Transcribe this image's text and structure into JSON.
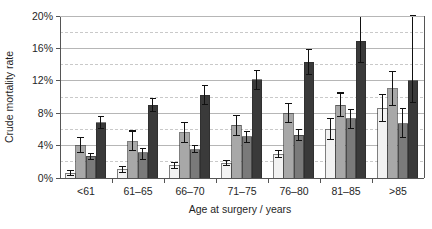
{
  "chart_data": {
    "type": "bar",
    "title": "",
    "xlabel": "Age at surgery / years",
    "ylabel": "Crude mortality rate",
    "categories": [
      "<61",
      "61–65",
      "66–70",
      "71–75",
      "76–80",
      "81–85",
      ">85"
    ],
    "ylim": [
      0,
      20
    ],
    "yunit": "%",
    "yticks": [
      0,
      4,
      8,
      12,
      16,
      20
    ],
    "yticklabels": [
      "0%",
      "4%",
      "8%",
      "12%",
      "16%",
      "20%"
    ],
    "yminor": [
      2,
      6,
      10,
      14,
      18
    ],
    "grid": "horizontal major solid plus dashed minor",
    "legend": "none",
    "error_bars": "vertical whiskers with caps (95% CI)",
    "series": [
      {
        "name": "series-1",
        "color": "#f2f2f2",
        "values": [
          0.6,
          1.0,
          1.5,
          1.8,
          2.9,
          6.0,
          8.6
        ],
        "err_low": [
          0.3,
          0.7,
          1.2,
          1.5,
          2.5,
          4.7,
          7.0
        ],
        "err_high": [
          0.9,
          1.4,
          1.9,
          2.2,
          3.4,
          7.3,
          10.3
        ]
      },
      {
        "name": "series-2",
        "color": "#a8a8a8",
        "values": [
          4.0,
          4.5,
          5.6,
          6.5,
          8.0,
          9.0,
          11.0
        ],
        "err_low": [
          3.1,
          3.4,
          4.4,
          5.3,
          6.9,
          7.6,
          8.9
        ],
        "err_high": [
          5.0,
          5.8,
          6.9,
          7.7,
          9.2,
          10.5,
          13.2
        ]
      },
      {
        "name": "series-3",
        "color": "#7a7a7a",
        "values": [
          2.7,
          3.1,
          3.5,
          5.1,
          5.3,
          7.3,
          6.7
        ],
        "err_low": [
          2.3,
          2.3,
          3.1,
          4.4,
          4.6,
          6.1,
          5.0
        ],
        "err_high": [
          3.0,
          3.6,
          4.0,
          5.7,
          6.0,
          8.5,
          8.6
        ]
      },
      {
        "name": "series-4",
        "color": "#3a3a3a",
        "values": [
          6.8,
          9.0,
          10.2,
          12.1,
          14.3,
          16.9,
          12.0
        ],
        "err_low": [
          6.1,
          8.2,
          9.1,
          10.9,
          12.8,
          14.3,
          9.3
        ],
        "err_high": [
          7.6,
          9.8,
          11.4,
          13.3,
          15.9,
          19.9,
          20.0
        ]
      }
    ]
  },
  "axes": {
    "ylabel": "Crude mortality rate",
    "xlabel": "Age at surgery / years"
  }
}
